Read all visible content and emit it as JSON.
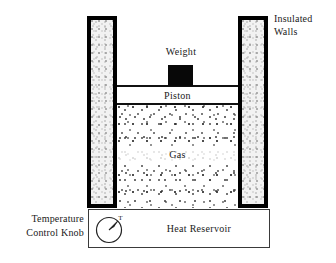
{
  "figure": {
    "type": "physics-schematic"
  },
  "labels": {
    "insulated_walls": "Insulated\nWalls",
    "insulated_walls_line1": "Insulated",
    "insulated_walls_line2": "Walls",
    "weight": "Weight",
    "piston": "Piston",
    "gas": "Gas",
    "heat_reservoir": "Heat Reservoir",
    "temperature_control_knob_line1": "Temperature",
    "temperature_control_knob_line2": "Control Knob",
    "knob_dial_marker": "T"
  },
  "colors": {
    "wall_border": "#000000",
    "wall_fill": "#f2f2f2",
    "weight_fill": "#080808",
    "gas_particles": "#333333",
    "outline": "#3a3a3a",
    "background": "#ffffff",
    "text": "#1a1a1a"
  },
  "components": [
    {
      "name": "insulated-wall-left",
      "shape": "rectangle",
      "fill": "stippled-gray",
      "border": "thick-black"
    },
    {
      "name": "insulated-wall-right",
      "shape": "rectangle",
      "fill": "stippled-gray",
      "border": "thick-black"
    },
    {
      "name": "piston",
      "shape": "rectangle",
      "fill": "white",
      "border": "horizontal-black-lines"
    },
    {
      "name": "weight",
      "shape": "rectangle",
      "fill": "solid-black",
      "border": "none"
    },
    {
      "name": "gas-chamber",
      "shape": "rectangle",
      "fill": "dotted-particles",
      "border": "none"
    },
    {
      "name": "heat-reservoir",
      "shape": "rectangle",
      "fill": "white",
      "border": "thin-black"
    },
    {
      "name": "temperature-control-knob",
      "shape": "circle",
      "fill": "white",
      "border": "thin-black"
    }
  ]
}
